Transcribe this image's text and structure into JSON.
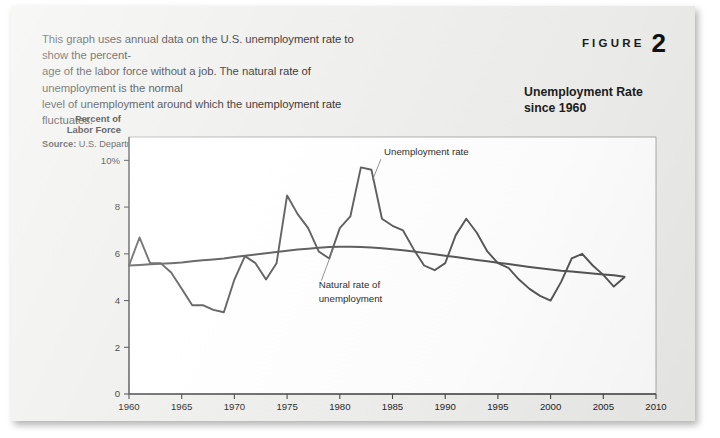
{
  "figure": {
    "label_word": "FIGURE",
    "number": "2",
    "title_line1": "Unemployment Rate",
    "title_line2": "since 1960"
  },
  "caption": {
    "line1": "This graph uses annual data on the U.S. unemployment rate to show the percent-",
    "line2": "age of the labor force without a job. The natural rate of unemployment is the normal",
    "line3": "level of unemployment around which the unemployment rate fluctuates.",
    "source_label": "Source:",
    "source_text": "U.S. Department of Labor, Congressional Budget Office."
  },
  "chart_data": {
    "type": "line",
    "title": "Unemployment Rate since 1960",
    "xlabel": "",
    "ylabel_line1": "Percent of",
    "ylabel_line2": "Labor Force",
    "xlim": [
      1960,
      2010
    ],
    "ylim": [
      0,
      11
    ],
    "grid": false,
    "legend_position": "inline-annotations",
    "xticks": [
      1960,
      1965,
      1970,
      1975,
      1980,
      1985,
      1990,
      1995,
      2000,
      2005,
      2010
    ],
    "xtick_labels": [
      "1960",
      "1965",
      "1970",
      "1975",
      "1980",
      "1985",
      "1990",
      "1995",
      "2000",
      "2005",
      "2010"
    ],
    "yticks": [
      0,
      2,
      4,
      6,
      8,
      10
    ],
    "ytick_labels": [
      "0",
      "2",
      "4",
      "6",
      "8",
      "10%"
    ],
    "annotations": [
      {
        "name": "unemployment-rate-label",
        "text": "Unemployment rate",
        "x": 1984.2,
        "y": 10.25
      },
      {
        "name": "natural-rate-label-line1",
        "text": "Natural rate of",
        "x": 1978.0,
        "y": 4.55
      },
      {
        "name": "natural-rate-label-line2",
        "text": "unemployment",
        "x": 1978.0,
        "y": 3.95
      }
    ],
    "x": [
      1960,
      1961,
      1962,
      1963,
      1964,
      1965,
      1966,
      1967,
      1968,
      1969,
      1970,
      1971,
      1972,
      1973,
      1974,
      1975,
      1976,
      1977,
      1978,
      1979,
      1980,
      1981,
      1982,
      1983,
      1984,
      1985,
      1986,
      1987,
      1988,
      1989,
      1990,
      1991,
      1992,
      1993,
      1994,
      1995,
      1996,
      1997,
      1998,
      1999,
      2000,
      2001,
      2002,
      2003,
      2004,
      2005,
      2006,
      2007
    ],
    "series": [
      {
        "name": "Unemployment rate",
        "color": "#555555",
        "values": [
          5.5,
          6.7,
          5.6,
          5.6,
          5.2,
          4.5,
          3.8,
          3.8,
          3.6,
          3.5,
          4.9,
          5.9,
          5.6,
          4.9,
          5.6,
          8.5,
          7.7,
          7.1,
          6.1,
          5.8,
          7.1,
          7.6,
          9.7,
          9.6,
          7.5,
          7.2,
          7.0,
          6.2,
          5.5,
          5.3,
          5.6,
          6.8,
          7.5,
          6.9,
          6.1,
          5.6,
          5.4,
          4.9,
          4.5,
          4.2,
          4.0,
          4.8,
          5.8,
          6.0,
          5.5,
          5.1,
          4.6,
          5.0
        ]
      },
      {
        "name": "Natural rate of unemployment",
        "color": "#555555",
        "values": [
          5.5,
          5.52,
          5.55,
          5.58,
          5.6,
          5.63,
          5.68,
          5.72,
          5.76,
          5.8,
          5.86,
          5.92,
          5.97,
          6.02,
          6.08,
          6.13,
          6.18,
          6.22,
          6.26,
          6.29,
          6.3,
          6.3,
          6.29,
          6.27,
          6.24,
          6.2,
          6.15,
          6.1,
          6.04,
          5.98,
          5.92,
          5.86,
          5.8,
          5.74,
          5.68,
          5.62,
          5.56,
          5.5,
          5.44,
          5.38,
          5.33,
          5.28,
          5.24,
          5.2,
          5.16,
          5.12,
          5.08,
          5.02
        ]
      }
    ]
  },
  "plot_geometry": {
    "frame_left": 118,
    "frame_right": 645,
    "frame_top": 131,
    "frame_bottom": 388
  }
}
